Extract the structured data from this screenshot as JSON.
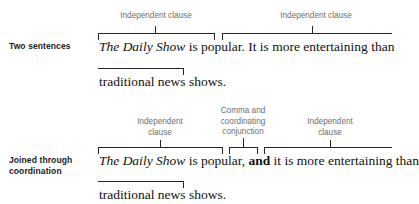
{
  "figure": {
    "type": "grammar-bracket-diagram",
    "rows": [
      {
        "id": "two-sentences",
        "row_label": "Two sentences",
        "annotations": [
          {
            "id": "ann-1-left",
            "text": "Independent clause"
          },
          {
            "id": "ann-1-right",
            "text": "Independent clause"
          }
        ],
        "sentence_line_1_parts": {
          "italic_title": "The Daily Show",
          "clause_one_rest": " is popular.",
          "clause_two": " It is more entertaining than"
        },
        "sentence_line_2": "traditional news shows."
      },
      {
        "id": "joined-through-coordination",
        "row_label": "Joined through\ncoordination",
        "annotations": [
          {
            "id": "ann-2-left",
            "text": "Independent\nclause"
          },
          {
            "id": "ann-2-mid",
            "text": "Comma and\ncoordinating\nconjunction"
          },
          {
            "id": "ann-2-right",
            "text": "Independent\nclause"
          }
        ],
        "sentence_line_1_parts": {
          "italic_title": "The Daily Show",
          "clause_one_rest": " is popular,",
          "conjunction": " and",
          "clause_two": " it is more entertaining than"
        },
        "sentence_line_2": "traditional news shows."
      }
    ],
    "colors": {
      "annotation_text": "#6e6e6e",
      "row_label_text": "#1a1a1a",
      "sentence_text": "#111111",
      "bracket_stroke": "#262626",
      "background": "#ffffff"
    }
  }
}
